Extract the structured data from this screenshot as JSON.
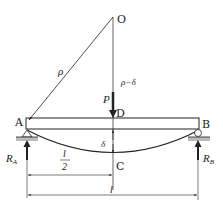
{
  "diagram": {
    "type": "simply-supported beam deflection",
    "labels": {
      "center_O": "O",
      "radius": "ρ",
      "radius_minus_delta": "ρ−δ",
      "load": "P",
      "point_D": "D",
      "point_A": "A",
      "point_B": "B",
      "point_C": "C",
      "deflection": "δ",
      "reaction_A_main": "R",
      "reaction_A_sub": "A",
      "reaction_B_main": "R",
      "reaction_B_sub": "B",
      "half_span_num": "l",
      "half_span_den": "2",
      "span": "l"
    },
    "colors": {
      "line": "#222222",
      "ground": "#bbbbbb",
      "background": "#ffffff"
    }
  }
}
